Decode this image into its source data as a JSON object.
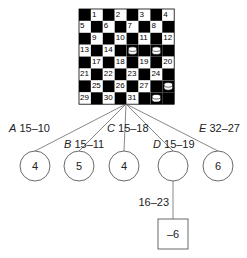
{
  "board": {
    "squares": [
      "1",
      "2",
      "3",
      "4",
      "5",
      "6",
      "7",
      "8",
      "9",
      "10",
      "11",
      "12",
      "13",
      "14",
      "15",
      "16",
      "17",
      "18",
      "19",
      "20",
      "21",
      "22",
      "23",
      "24",
      "25",
      "26",
      "27",
      "28",
      "29",
      "30",
      "31",
      "32"
    ],
    "pieces_on": [
      "15",
      "16",
      "28",
      "32"
    ],
    "colors": {
      "dark": "#000000",
      "light": "#ffffff",
      "piece": "#ffffff",
      "line": "#555555"
    }
  },
  "moves": [
    {
      "letter": "A",
      "move": "15–10",
      "value": "4"
    },
    {
      "letter": "B",
      "move": "15–11",
      "value": "5"
    },
    {
      "letter": "C",
      "move": "15–18",
      "value": "4"
    },
    {
      "letter": "D",
      "move": "15–19",
      "value": ""
    },
    {
      "letter": "E",
      "move": "32–27",
      "value": "6"
    }
  ],
  "reply": {
    "move": "16–23",
    "value": "–6"
  }
}
